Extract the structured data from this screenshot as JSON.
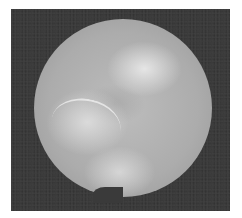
{
  "image": {
    "description": "Grayscale circular endoscopic view on a dark square background",
    "colors": {
      "background": "#ffffff",
      "frame": "#3a3a3a",
      "scope_mid": "#acacac",
      "highlight": "#ebebeb"
    }
  }
}
